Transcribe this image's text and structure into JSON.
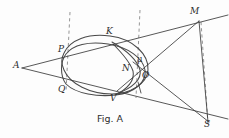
{
  "figure": {
    "caption": "Fig. A",
    "caption_pos": {
      "x": 97,
      "y": 114
    },
    "width": 229,
    "height": 138,
    "background": "#fdfdfd",
    "ink_color": "#3a3a3a",
    "dash_color": "#8a8a8a",
    "points": [
      {
        "key": "A",
        "label": "A",
        "x": 22,
        "y": 68,
        "label_x": 13,
        "label_y": 61
      },
      {
        "key": "P",
        "label": "P",
        "x": 64,
        "y": 53,
        "label_x": 58,
        "label_y": 45
      },
      {
        "key": "Q",
        "label": "Q",
        "x": 66,
        "y": 84,
        "label_x": 58,
        "label_y": 85
      },
      {
        "key": "K",
        "label": "K",
        "x": 112,
        "y": 43,
        "label_x": 106,
        "label_y": 27
      },
      {
        "key": "N",
        "label": "N",
        "x": 131,
        "y": 70,
        "label_x": 122,
        "label_y": 64
      },
      {
        "key": "mu",
        "label": "μ",
        "x": 141,
        "y": 64,
        "label_x": 137,
        "label_y": 55
      },
      {
        "key": "O",
        "label": "O",
        "x": 145,
        "y": 73,
        "label_x": 142,
        "label_y": 71
      },
      {
        "key": "V",
        "label": "V",
        "x": 115,
        "y": 95,
        "label_x": 110,
        "label_y": 94
      },
      {
        "key": "M",
        "label": "M",
        "x": 199,
        "y": 21,
        "label_x": 190,
        "label_y": 7
      },
      {
        "key": "S",
        "label": "S",
        "x": 208,
        "y": 122,
        "label_x": 204,
        "label_y": 120
      }
    ],
    "solid_lines": [
      {
        "name": "line-A-P-K-M-extended",
        "x1": 22,
        "y1": 68,
        "x2": 228,
        "y2": 15
      },
      {
        "name": "line-A-Q-V-S-extended",
        "x1": 22,
        "y1": 68,
        "x2": 228,
        "y2": 119
      },
      {
        "name": "line-M-to-S",
        "x1": 199,
        "y1": 21,
        "x2": 208,
        "y2": 122
      },
      {
        "name": "line-M-through-N-O",
        "x1": 199,
        "y1": 21,
        "x2": 117,
        "y2": 91
      },
      {
        "name": "line-O-to-S",
        "x1": 133,
        "y1": 62,
        "x2": 209,
        "y2": 122
      },
      {
        "name": "tick-on-AV-line",
        "x1": 138,
        "y1": 82,
        "x2": 141,
        "y2": 93
      }
    ],
    "dashed_lines": [
      {
        "name": "dashed-vertical-left",
        "x1": 70,
        "y1": 12,
        "x2": 66,
        "y2": 92
      },
      {
        "name": "dashed-vertical-middle",
        "x1": 140,
        "y1": 10,
        "x2": 136,
        "y2": 98
      },
      {
        "name": "dashed-vertical-right",
        "x1": 201,
        "y1": 22,
        "x2": 208,
        "y2": 124
      }
    ],
    "curves": [
      {
        "name": "oval-outer",
        "d": "M 64,53 C 70,40 88,33 110,36 C 134,39 149,55 148,70 C 147,84 130,94 112,94 C 90,94 70,84 64,70 C 61,63 61,59 64,53 Z"
      },
      {
        "name": "oval-inner-overlapping",
        "d": "M 66,84 C 60,76 60,62 66,54 C 73,45 88,41 108,44 C 128,47 143,58 145,70 C 147,82 134,93 116,95 C 98,97 76,94 66,84 Z"
      },
      {
        "name": "arc-K-to-V-right-lobe",
        "d": "M 112,42 C 126,50 137,60 140,70 C 142,79 133,88 116,94"
      },
      {
        "name": "arc-K-to-V-inner",
        "d": "M 113,44 C 122,53 130,62 133,71 C 135,80 128,89 115,95"
      }
    ]
  }
}
